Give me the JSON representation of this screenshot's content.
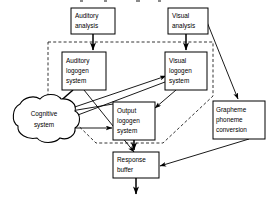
{
  "figure": {
    "title_fragment": "",
    "type": "flow-diagram",
    "background_color": "#ffffff",
    "line_color": "#000000",
    "width": 269,
    "height": 199
  },
  "nodes": {
    "auditory_analysis": {
      "label_lines": [
        "Auditory",
        "analysis"
      ],
      "line1": "Auditory",
      "line2": "analysis",
      "shape": "rectangle",
      "x": 71,
      "y": 8,
      "w": 44,
      "h": 26
    },
    "visual_analysis": {
      "label_lines": [
        "Visual",
        "analysis"
      ],
      "line1": "Visual",
      "line2": "analysis",
      "shape": "rectangle",
      "x": 168,
      "y": 8,
      "w": 40,
      "h": 26
    },
    "auditory_logogen_system": {
      "label_lines": [
        "Auditory",
        "logogen",
        "system"
      ],
      "line1": "Auditory",
      "line2": "logogen",
      "line3": "system",
      "shape": "rectangle",
      "x": 62,
      "y": 52,
      "w": 44,
      "h": 38
    },
    "visual_logogen_system": {
      "label_lines": [
        "Visual",
        "logogen",
        "system"
      ],
      "line1": "Visual",
      "line2": "logogen",
      "line3": "system",
      "shape": "rectangle",
      "x": 165,
      "y": 52,
      "w": 42,
      "h": 38
    },
    "output_logogen_system": {
      "label_lines": [
        "Output",
        "logogen",
        "system"
      ],
      "line1": "Output",
      "line2": "logogen",
      "line3": "system",
      "shape": "rectangle",
      "x": 113,
      "y": 102,
      "w": 42,
      "h": 38
    },
    "grapheme_phoneme_conversion": {
      "label_lines": [
        "Grapheme",
        "phoneme",
        "conversion"
      ],
      "line1": "Grapheme",
      "line2": "phoneme",
      "line3": "conversion",
      "shape": "rectangle",
      "x": 213,
      "y": 101,
      "w": 50,
      "h": 38
    },
    "response_buffer": {
      "label_lines": [
        "Response",
        "buffer"
      ],
      "line1": "Response",
      "line2": "buffer",
      "shape": "rectangle",
      "x": 113,
      "y": 152,
      "w": 46,
      "h": 26
    },
    "cognitive_system": {
      "label_lines": [
        "Cognitive",
        "system"
      ],
      "line1": "Cognitive",
      "line2": "system",
      "shape": "cloud",
      "cx": 41,
      "cy": 117
    }
  },
  "grouping": {
    "dashed_boundary_name": "logogen-system-boundary",
    "style": "dashed"
  },
  "edges": [
    {
      "name": "auditory-analysis-to-auditory-logogen",
      "from": "auditory_analysis",
      "to": "auditory_logogen_system",
      "style": "solid-arrow"
    },
    {
      "name": "visual-analysis-to-visual-logogen",
      "from": "visual_analysis",
      "to": "visual_logogen_system",
      "style": "solid-arrow"
    },
    {
      "name": "visual-analysis-to-grapheme-phoneme",
      "from": "visual_analysis",
      "to": "grapheme_phoneme_conversion",
      "style": "solid-arrow"
    },
    {
      "name": "auditory-logogen-to-cognitive-system",
      "from": "auditory_logogen_system",
      "to": "cognitive_system",
      "style": "solid-arrow"
    },
    {
      "name": "auditory-logogen-to-output-logogen",
      "from": "auditory_logogen_system",
      "to": "output_logogen_system",
      "style": "solid-arrow"
    },
    {
      "name": "visual-logogen-to-cognitive-system",
      "from": "visual_logogen_system",
      "to": "cognitive_system",
      "style": "solid-arrow"
    },
    {
      "name": "visual-logogen-to-output-logogen",
      "from": "visual_logogen_system",
      "to": "output_logogen_system",
      "style": "solid-arrow"
    },
    {
      "name": "cognitive-system-to-visual-logogen",
      "from": "cognitive_system",
      "to": "visual_logogen_system",
      "style": "solid-arrow"
    },
    {
      "name": "cognitive-system-to-output-logogen",
      "from": "cognitive_system",
      "to": "output_logogen_system",
      "style": "solid-arrow"
    },
    {
      "name": "output-logogen-to-cognitive-system",
      "from": "output_logogen_system",
      "to": "cognitive_system",
      "style": "solid-arrow"
    },
    {
      "name": "output-logogen-to-response-buffer",
      "from": "output_logogen_system",
      "to": "response_buffer",
      "style": "solid-arrow"
    },
    {
      "name": "grapheme-phoneme-to-response-buffer",
      "from": "grapheme_phoneme_conversion",
      "to": "response_buffer",
      "style": "solid-arrow"
    },
    {
      "name": "response-buffer-to-speech-output",
      "from": "response_buffer",
      "to": "output",
      "style": "solid-arrow"
    }
  ]
}
